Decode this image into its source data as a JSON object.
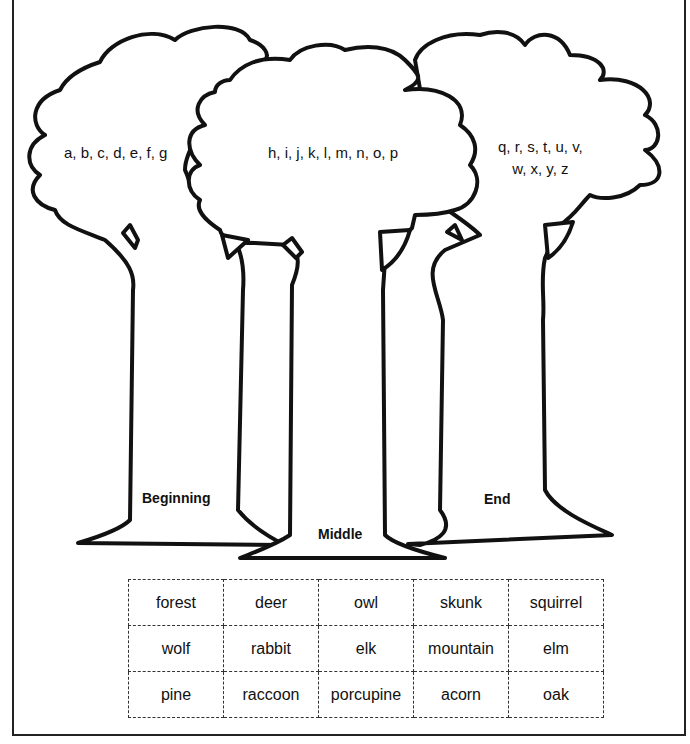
{
  "trees": [
    {
      "label": "Beginning",
      "letters": "a, b, c, d, e, f, g"
    },
    {
      "label": "Middle",
      "letters": "h, i, j, k, l, m, n, o, p"
    },
    {
      "label": "End",
      "letters_line1": "q, r, s, t, u, v,",
      "letters_line2": "w, x, y, z"
    }
  ],
  "word_bank": {
    "rows": [
      [
        "forest",
        "deer",
        "owl",
        "skunk",
        "squirrel"
      ],
      [
        "wolf",
        "rabbit",
        "elk",
        "mountain",
        "elm"
      ],
      [
        "pine",
        "raccoon",
        "porcupine",
        "acorn",
        "oak"
      ]
    ]
  },
  "colors": {
    "ink": "#111111",
    "paper": "#ffffff"
  }
}
